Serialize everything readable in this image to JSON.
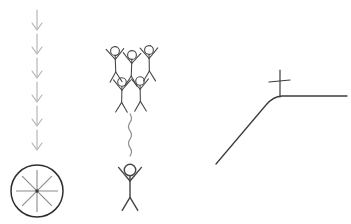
{
  "canvas": {
    "width": 351,
    "height": 224,
    "background": "#ffffff"
  },
  "left_sequence": {
    "description": "chain-of-down-arrows-into-spoked-wheel",
    "arrows": {
      "count": 6,
      "x": 37,
      "head_ys": [
        30,
        54,
        78,
        102,
        126,
        150
      ],
      "shaft_length": 18,
      "head_half_width": 5,
      "head_depth": 7,
      "color": "#b0b0b0",
      "stroke_width": 1.1
    },
    "wheel": {
      "cx": 37,
      "cy": 191,
      "r": 26,
      "ring_color": "#2e2e2e",
      "ring_width": 1.5,
      "spoke_count": 8,
      "spoke_length": 21,
      "spoke_color": "#8b8b8b",
      "spoke_width": 1.1,
      "hub_radius": 1.7,
      "hub_color": "#3a3a3a"
    }
  },
  "crowd": {
    "description": "five-cheering-stick-figures-above-squiggle-above-single-figure",
    "color": "#474747",
    "stroke_width": 1.1,
    "proto": {
      "head_r": 4.4,
      "neck_y": 4.6,
      "hip_y": 21,
      "arm_origin_y": 8.5,
      "arm_x": 8.8,
      "arm_y": -2,
      "leg_x": 6,
      "foot_y": 31
    },
    "figures": [
      {
        "x": 115,
        "y": 51,
        "scale": 1.0,
        "tilt": -2
      },
      {
        "x": 132,
        "y": 55,
        "scale": 1.0,
        "tilt": 2
      },
      {
        "x": 149,
        "y": 50,
        "scale": 1.0,
        "tilt": -1
      },
      {
        "x": 122,
        "y": 82,
        "scale": 0.97,
        "tilt": 1
      },
      {
        "x": 140,
        "y": 81,
        "scale": 0.97,
        "tilt": -1
      },
      {
        "x": 130,
        "y": 170,
        "scale": 1.3,
        "tilt": 0
      }
    ]
  },
  "squiggle": {
    "x": 130,
    "y_top": 114,
    "y_bottom": 156,
    "amplitude": 3,
    "wavelength": 8.4,
    "color": "#8f8f8f",
    "stroke_width": 1.2
  },
  "hill": {
    "d": "M 216 164 L 266 105 Q 273 96.5 282 96 L 347 96",
    "color": "#3c3c3c",
    "stroke_width": 1.3
  },
  "cross": {
    "x": 280,
    "y_top": 70,
    "y_bottom": 97,
    "bar_x1": 269,
    "bar_y1": 82,
    "bar_x2": 290,
    "bar_y2": 80,
    "color": "#3c3c3c",
    "stroke_width": 1.2
  }
}
